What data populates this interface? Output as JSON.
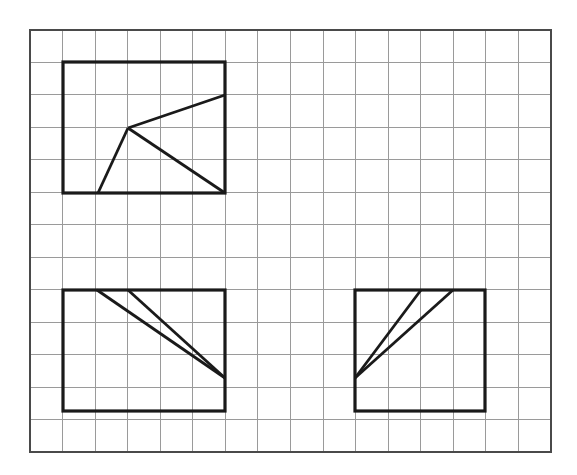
{
  "document": {
    "title": "Grid Geometry Figures",
    "background_color": "#ffffff",
    "width": 577,
    "height": 475
  },
  "grid": {
    "name": "square-grid",
    "x": 30,
    "y": 30,
    "width": 521,
    "height": 422,
    "columns": 16,
    "rows": 13,
    "cell_width": 32.5625,
    "cell_height": 32.4615,
    "line_color": "#9a9a9a",
    "line_width": 1,
    "border_color": "#4a4a4a",
    "border_width": 2
  },
  "style": {
    "shape_stroke_color": "#1a1a1a",
    "shape_stroke_width": 3.2,
    "ray_stroke_width": 2.8,
    "shape_fill": "none"
  },
  "figures": [
    {
      "id": "figure-1",
      "label": "top-left-figure",
      "shape": "rectangle-with-three-rays",
      "rect": {
        "x1": 63,
        "y1": 62,
        "x2": 225,
        "y2": 193
      },
      "vertex": {
        "x": 128,
        "y": 128
      },
      "rays": [
        {
          "name": "ray-upper-right",
          "x1": 128,
          "y1": 128,
          "x2": 225,
          "y2": 95
        },
        {
          "name": "ray-lower-left",
          "x1": 128,
          "y1": 128,
          "x2": 98,
          "y2": 193
        },
        {
          "name": "ray-lower-right",
          "x1": 128,
          "y1": 128,
          "x2": 225,
          "y2": 193
        }
      ]
    },
    {
      "id": "figure-2",
      "label": "bottom-left-figure",
      "shape": "rectangle-with-two-converging-lines",
      "rect": {
        "x1": 63,
        "y1": 290,
        "x2": 225,
        "y2": 411
      },
      "vertex": {
        "x": 225,
        "y": 378
      },
      "rays": [
        {
          "name": "line-from-top-left",
          "x1": 97,
          "y1": 290,
          "x2": 225,
          "y2": 378
        },
        {
          "name": "line-from-top-mid",
          "x1": 128,
          "y1": 290,
          "x2": 225,
          "y2": 378
        }
      ]
    },
    {
      "id": "figure-3",
      "label": "bottom-right-figure",
      "shape": "rectangle-with-two-diverging-lines",
      "rect": {
        "x1": 355,
        "y1": 290,
        "x2": 485,
        "y2": 411
      },
      "vertex": {
        "x": 355,
        "y": 378
      },
      "rays": [
        {
          "name": "line-to-top-mid",
          "x1": 355,
          "y1": 378,
          "x2": 421,
          "y2": 290
        },
        {
          "name": "line-to-top-right",
          "x1": 355,
          "y1": 378,
          "x2": 453,
          "y2": 290
        }
      ]
    }
  ],
  "chart_data": {
    "type": "diagram",
    "grid_columns": 16,
    "grid_rows": 13,
    "figure_count": 3,
    "figures_summary": [
      "Top-left rectangle 5 by 4 cells with a central vertex and three rays",
      "Bottom-left rectangle 5 by 4 cells with two lines converging at the right edge",
      "Bottom-right rectangle 4 by 4 cells with two lines diverging from the left edge"
    ]
  }
}
